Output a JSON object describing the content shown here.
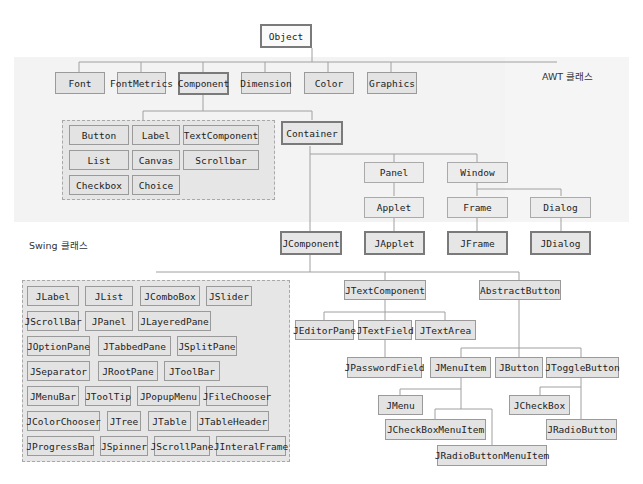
{
  "labels": {
    "awt": "AWT 클래스",
    "swing": "Swing 클래스"
  },
  "root": "Object",
  "awt_top": [
    "Font",
    "FontMetrics",
    "Component",
    "Dimension",
    "Color",
    "Graphics"
  ],
  "awt_components": [
    "Button",
    "Label",
    "TextComponent",
    "List",
    "Canvas",
    "Scrollbar",
    "Checkbox",
    "Choice"
  ],
  "container": "Container",
  "container_children": [
    "Panel",
    "Window"
  ],
  "awt_windows": [
    "Applet",
    "Frame",
    "Dialog"
  ],
  "swing_top": [
    "JComponent",
    "JApplet",
    "JFrame",
    "JDialog"
  ],
  "swing_components": [
    "JLabel",
    "JList",
    "JComboBox",
    "JSlider",
    "JScrollBar",
    "JPanel",
    "JLayeredPane",
    "JOptionPane",
    "JTabbedPane",
    "JSplitPane",
    "JSeparator",
    "JRootPane",
    "JToolBar",
    "JMenuBar",
    "JToolTip",
    "JPopupMenu",
    "JFileChooser",
    "JColorChooser",
    "JTree",
    "JTable",
    "JTableHeader",
    "JProgressBar",
    "JSpinner",
    "JScrollPane",
    "JInteralFrame"
  ],
  "text": {
    "jtextcomponent": "JTextComponent",
    "children": [
      "JEditorPane",
      "JTextField",
      "JTextArea"
    ],
    "jpasswordfield": "JPasswordField"
  },
  "buttons": {
    "abstractbutton": "AbstractButton",
    "children": [
      "JMenuItem",
      "JButton",
      "JToggleButton"
    ],
    "menu_children": [
      "JMenu",
      "JCheckBoxMenuItem",
      "JRadioButtonMenuItem"
    ],
    "toggle_children": [
      "JCheckBox",
      "JRadioButton"
    ]
  },
  "colors": {
    "band": "#f3f3f3",
    "box": "#e3e3e3",
    "border": "#9a9a9a",
    "line": "#a0a0a0"
  }
}
